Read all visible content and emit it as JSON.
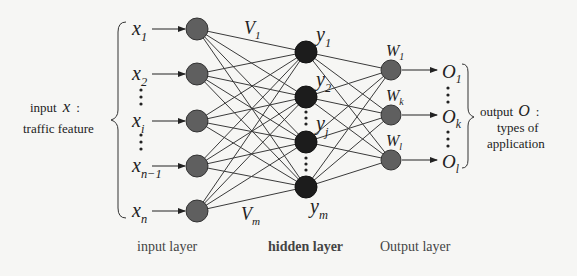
{
  "diagram": {
    "type": "neural-network",
    "colors": {
      "background": "#f6f6f4",
      "input_node": "#5f5f5f",
      "hidden_node": "#1c1c1c",
      "output_node": "#5f5f5f",
      "edge": "#3a3a3a"
    },
    "input": {
      "description_line1": "input",
      "description_symbol": "x",
      "description_colon": ":",
      "description_line2": "traffic feature",
      "nodes": [
        {
          "base": "x",
          "sub": "1"
        },
        {
          "base": "x",
          "sub": "2"
        },
        {
          "base": "x",
          "sub": "i"
        },
        {
          "base": "x",
          "sub": "n−1"
        },
        {
          "base": "x",
          "sub": "n"
        }
      ]
    },
    "weights_v": [
      {
        "base": "V",
        "sub": "1"
      },
      {
        "base": "V",
        "sub": "m"
      }
    ],
    "hidden": {
      "nodes": [
        {
          "base": "y",
          "sub": "1"
        },
        {
          "base": "y",
          "sub": "2"
        },
        {
          "base": "y",
          "sub": "j"
        },
        {
          "base": "y",
          "sub": "m"
        }
      ]
    },
    "output": {
      "weights_w": [
        {
          "base": "W",
          "sub": "1"
        },
        {
          "base": "W",
          "sub": "k"
        },
        {
          "base": "W",
          "sub": "l"
        }
      ],
      "nodes": [
        {
          "base": "O",
          "sub": "1"
        },
        {
          "base": "O",
          "sub": "k"
        },
        {
          "base": "O",
          "sub": "l"
        }
      ],
      "description_line1": "output",
      "description_symbol": "O",
      "description_colon": ":",
      "description_line2": "types of",
      "description_line3": "application"
    },
    "layer_labels": {
      "input": "input layer",
      "hidden": "hidden layer",
      "output": "Output layer"
    }
  }
}
